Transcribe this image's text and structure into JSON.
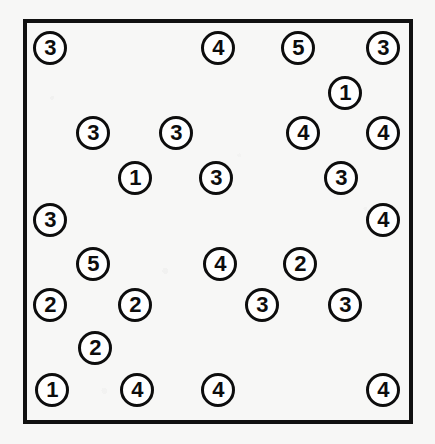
{
  "scene": {
    "title": "Numbered circle tokens inside a rectangular frame",
    "canvas_width": 435,
    "canvas_height": 444,
    "background_color": "#f7f7f6",
    "ink_color": "#0d0d0d"
  },
  "frame": {
    "name": "outer-rectangle",
    "x": 23,
    "y": 19,
    "width": 390,
    "height": 405,
    "border_width": 4,
    "border_color": "#111111"
  },
  "token_style": {
    "radius": 17,
    "border_width": 3,
    "fill_color": "#ffffff",
    "border_color": "#0d0d0d",
    "font_size": 22
  },
  "legend": {
    "distinct_values": [
      "1",
      "2",
      "3",
      "4",
      "5"
    ],
    "total_tokens": 26
  },
  "counts": {
    "1": 3,
    "2": 5,
    "3": 10,
    "4": 8,
    "5": 2
  },
  "chart_data": {
    "type": "scatter",
    "xlabel": "",
    "ylabel": "",
    "xlim": [
      23,
      413
    ],
    "ylim": [
      19,
      424
    ],
    "grid": false,
    "legend_position": "none",
    "marker": "circle-outline-with-number",
    "points": [
      {
        "id": "t01",
        "x": 50,
        "y": 48,
        "label": "3"
      },
      {
        "id": "t02",
        "x": 218,
        "y": 48,
        "label": "4"
      },
      {
        "id": "t03",
        "x": 298,
        "y": 48,
        "label": "5"
      },
      {
        "id": "t04",
        "x": 383,
        "y": 48,
        "label": "3"
      },
      {
        "id": "t05",
        "x": 345,
        "y": 93,
        "label": "1"
      },
      {
        "id": "t06",
        "x": 93,
        "y": 133,
        "label": "3"
      },
      {
        "id": "t07",
        "x": 176,
        "y": 133,
        "label": "3"
      },
      {
        "id": "t08",
        "x": 303,
        "y": 133,
        "label": "4"
      },
      {
        "id": "t09",
        "x": 383,
        "y": 133,
        "label": "4"
      },
      {
        "id": "t10",
        "x": 135,
        "y": 178,
        "label": "1"
      },
      {
        "id": "t11",
        "x": 216,
        "y": 178,
        "label": "3"
      },
      {
        "id": "t12",
        "x": 341,
        "y": 178,
        "label": "3"
      },
      {
        "id": "t13",
        "x": 50,
        "y": 220,
        "label": "3"
      },
      {
        "id": "t14",
        "x": 383,
        "y": 220,
        "label": "4"
      },
      {
        "id": "t15",
        "x": 93,
        "y": 264,
        "label": "5"
      },
      {
        "id": "t16",
        "x": 220,
        "y": 264,
        "label": "4"
      },
      {
        "id": "t17",
        "x": 300,
        "y": 264,
        "label": "2"
      },
      {
        "id": "t18",
        "x": 50,
        "y": 305,
        "label": "2"
      },
      {
        "id": "t19",
        "x": 135,
        "y": 305,
        "label": "2"
      },
      {
        "id": "t20",
        "x": 262,
        "y": 305,
        "label": "3"
      },
      {
        "id": "t21",
        "x": 345,
        "y": 305,
        "label": "3"
      },
      {
        "id": "t22",
        "x": 95,
        "y": 348,
        "label": "2"
      },
      {
        "id": "t23",
        "x": 52,
        "y": 390,
        "label": "1"
      },
      {
        "id": "t24",
        "x": 137,
        "y": 390,
        "label": "4"
      },
      {
        "id": "t25",
        "x": 218,
        "y": 390,
        "label": "4"
      },
      {
        "id": "t26",
        "x": 383,
        "y": 390,
        "label": "4"
      }
    ]
  }
}
